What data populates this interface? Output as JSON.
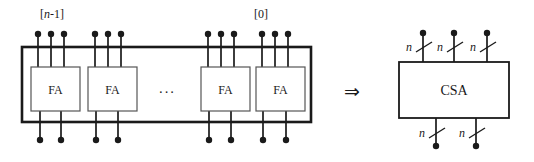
{
  "figure": {
    "colors": {
      "stroke": "#1a1a1a",
      "thin_stroke": "#555555",
      "background": "#ffffff",
      "box_fill": "#ffffff"
    },
    "left_diagram": {
      "outer_box": {
        "x": 22,
        "y": 47,
        "w": 289,
        "h": 75,
        "stroke_width": 2.4
      },
      "index_labels": [
        {
          "id": "msb-index-label",
          "text": "[n-1]",
          "italic_part": "n",
          "x": 40,
          "y": 18
        },
        {
          "id": "lsb-index-label",
          "text": "[0]",
          "italic_part": "",
          "x": 254,
          "y": 18
        }
      ],
      "fa_cells": [
        {
          "id": "fa-cell-0",
          "label": "FA",
          "x": 31,
          "y": 67,
          "w": 49,
          "h": 44,
          "visible": true
        },
        {
          "id": "fa-cell-1",
          "label": "FA",
          "x": 88,
          "y": 67,
          "w": 49,
          "h": 44,
          "visible": true
        },
        {
          "id": "fa-cell-2",
          "label": "FA",
          "x": 201,
          "y": 67,
          "w": 49,
          "h": 44,
          "visible": true
        },
        {
          "id": "fa-cell-3",
          "label": "FA",
          "x": 256,
          "y": 67,
          "w": 49,
          "h": 44,
          "visible": true
        }
      ],
      "ellipsis": {
        "id": "fa-cells-ellipsis",
        "text": "···",
        "x": 167,
        "y": 93
      },
      "input_dot_groups": [
        {
          "group": 0,
          "x": [
            38,
            51,
            64
          ],
          "dot_y": 34
        },
        {
          "group": 1,
          "x": [
            95,
            108,
            121
          ],
          "dot_y": 34
        },
        {
          "group": 2,
          "x": [
            208,
            221,
            234
          ],
          "dot_y": 34
        },
        {
          "group": 3,
          "x": [
            262,
            275,
            288
          ],
          "dot_y": 34
        }
      ],
      "output_dot_groups": [
        {
          "group": 0,
          "x": [
            40,
            61
          ],
          "dot_y": 140
        },
        {
          "group": 1,
          "x": [
            96,
            118
          ],
          "dot_y": 140
        },
        {
          "group": 2,
          "x": [
            209,
            231
          ],
          "dot_y": 140
        },
        {
          "group": 3,
          "x": [
            263,
            286
          ],
          "dot_y": 140
        }
      ],
      "dot_radius": 3.2
    },
    "transform_arrow": {
      "id": "implies-arrow",
      "glyph": "⇒",
      "x": 352,
      "y": 92
    },
    "right_diagram": {
      "box": {
        "x": 399,
        "y": 62,
        "w": 110,
        "h": 56,
        "stroke_width": 1.6
      },
      "box_label": "CSA",
      "input_buses": [
        {
          "id": "csa-input-bus-0",
          "x": 423,
          "label": "n",
          "dot_y": 33,
          "label_x": 408,
          "label_y": 49
        },
        {
          "id": "csa-input-bus-1",
          "x": 454,
          "label": "n",
          "dot_y": 33,
          "label_x": 439,
          "label_y": 49
        },
        {
          "id": "csa-input-bus-2",
          "x": 487,
          "label": "n",
          "dot_y": 33,
          "label_x": 472,
          "label_y": 49
        }
      ],
      "output_buses": [
        {
          "id": "csa-output-bus-0",
          "x": 436,
          "label": "n",
          "dot_y": 146,
          "label_x": 421,
          "label_y": 135
        },
        {
          "id": "csa-output-bus-1",
          "x": 476,
          "label": "n",
          "dot_y": 146,
          "label_x": 461,
          "label_y": 135
        }
      ],
      "dot_radius": 3.2
    }
  }
}
